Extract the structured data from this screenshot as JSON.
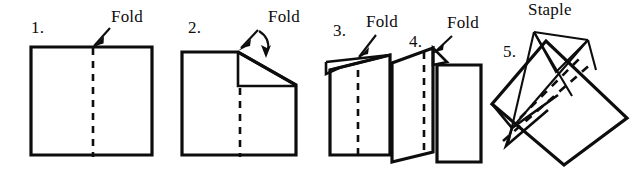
{
  "figure": {
    "width": 643,
    "height": 172,
    "ink_color": "#0d0d0d",
    "background_color": "#ffffff"
  },
  "steps": [
    {
      "number": "1.",
      "label": "Fold",
      "description": "Flat sheet with vertical dashed fold line down the middle; arrow points to top of fold line"
    },
    {
      "number": "2.",
      "label": "Fold",
      "description": "Sheet with top-right corner folded down along a diagonal; two arrows point at the fold"
    },
    {
      "number": "3.",
      "label": "Fold",
      "description": "Sheet seen in perspective with small triangular flap at top left and dashed fold line; arrow points at the fold"
    },
    {
      "number": "4.",
      "label": "Fold",
      "description": "Booklet opened showing left panel angled back and right panel forward; arrow points at the fold"
    },
    {
      "number": "5.",
      "label": "Staple",
      "description": "Tilted finished booklet with dashed spine; staple lines converge to the spine"
    }
  ],
  "labels": {
    "fold": "Fold",
    "staple": "Staple"
  }
}
